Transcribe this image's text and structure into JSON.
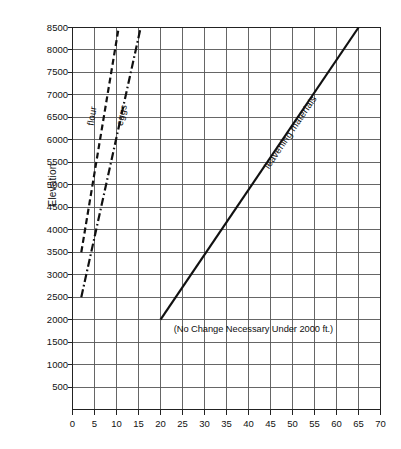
{
  "chart_data": {
    "type": "line",
    "title": "",
    "xlabel": "",
    "ylabel": "Elevation",
    "xlim": [
      0,
      70
    ],
    "ylim": [
      0,
      8500
    ],
    "xticks": [
      0,
      5,
      10,
      15,
      20,
      25,
      30,
      35,
      40,
      45,
      50,
      55,
      60,
      65,
      70
    ],
    "yticks": [
      500,
      1000,
      1500,
      2000,
      2500,
      3000,
      3500,
      4000,
      4500,
      5000,
      5500,
      6000,
      6500,
      7000,
      7500,
      8000,
      8500
    ],
    "grid": true,
    "legend_position": "inline-on-curve",
    "annotations": [
      {
        "name": "no-change-note",
        "text": "(No Change Necessary Under 2000 ft.)",
        "x": 23,
        "y": 1800
      }
    ],
    "series": [
      {
        "name": "flour",
        "label": "flour",
        "style": "dashed",
        "color": "#111111",
        "points": [
          [
            2,
            3500
          ],
          [
            10.5,
            8500
          ]
        ],
        "label_x": 4.0,
        "label_y": 6450
      },
      {
        "name": "eggs",
        "label": "eggs",
        "style": "dash-dot",
        "color": "#111111",
        "points": [
          [
            2,
            2500
          ],
          [
            15.5,
            8500
          ]
        ],
        "label_x": 10.5,
        "label_y": 6450
      },
      {
        "name": "leavening materials",
        "label": "leavening materials",
        "style": "solid",
        "color": "#111111",
        "points": [
          [
            20,
            2000
          ],
          [
            65,
            8500
          ]
        ],
        "label_x": 44.0,
        "label_y": 5500
      }
    ]
  },
  "axis": {
    "y_title": "Elevation",
    "y_labels": [
      "8500",
      "8000",
      "7500",
      "7000",
      "6500",
      "6000",
      "5500",
      "5000",
      "4500",
      "4000",
      "3500",
      "3000",
      "2500",
      "2000",
      "1500",
      "1000",
      "500"
    ],
    "x_labels": [
      "0",
      "5",
      "10",
      "15",
      "20",
      "25",
      "30",
      "35",
      "40",
      "45",
      "50",
      "55",
      "60",
      "65",
      "70"
    ]
  },
  "series_labels": {
    "flour": "flour",
    "eggs": "eggs",
    "leavening": "leavening materials"
  },
  "note": {
    "text": "(No Change Necessary Under 2000 ft.)"
  },
  "colors": {
    "ink": "#111111",
    "grid": "#555555",
    "frame": "#222222",
    "background": "#ffffff"
  }
}
